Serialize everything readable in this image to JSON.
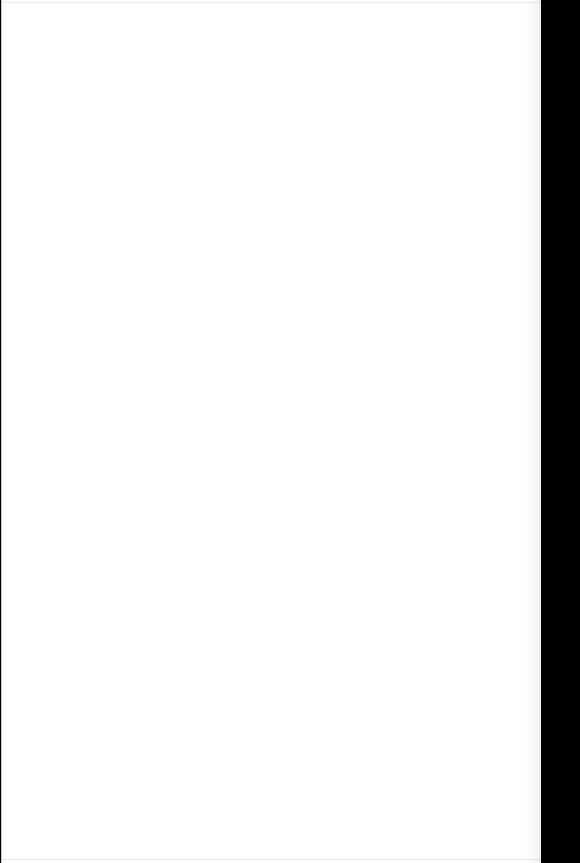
{
  "document": {
    "page_label": "",
    "body_text": "",
    "is_blank": true
  },
  "viewer": {
    "background_color": "#000000",
    "page_color": "#ffffff",
    "page_edge_color": "#d8d8d8"
  },
  "page_content": {
    "blank_note": ""
  }
}
